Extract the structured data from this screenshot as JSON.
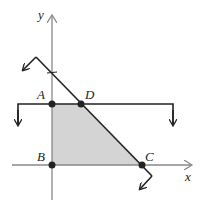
{
  "diagram": {
    "type": "feasible-region-graph",
    "axes": {
      "x_label": "x",
      "y_label": "y"
    },
    "points": [
      {
        "name": "A",
        "label": "A",
        "px": [
          52,
          104
        ]
      },
      {
        "name": "B",
        "label": "B",
        "px": [
          52,
          165
        ]
      },
      {
        "name": "C",
        "label": "C",
        "px": [
          142,
          165
        ]
      },
      {
        "name": "D",
        "label": "D",
        "px": [
          81,
          104
        ]
      }
    ],
    "shaded_region": {
      "vertices": [
        "A",
        "D",
        "C",
        "B"
      ],
      "fill": "#d4d4d4"
    },
    "boundary_lines": [
      {
        "name": "horizontal-constraint",
        "description": "horizontal line through A and D with downward shading arrows"
      },
      {
        "name": "diagonal-constraint",
        "description": "line through D and C with down-left shading arrows"
      }
    ],
    "colors": {
      "line": "#222222",
      "axis": "#888888",
      "region": "#d4d4d4"
    }
  }
}
